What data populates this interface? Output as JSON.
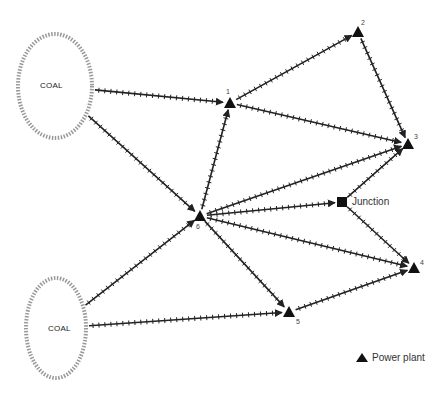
{
  "diagram": {
    "type": "network",
    "colors": {
      "edge": "#222222",
      "node": "#111111",
      "coal_outline": "#999999"
    },
    "sources": [
      {
        "id": "coal1",
        "label": "COAL",
        "cx": 55,
        "cy": 86,
        "rx": 37,
        "ry": 52
      },
      {
        "id": "coal2",
        "label": "COAL",
        "cx": 56,
        "cy": 328,
        "rx": 30,
        "ry": 50
      }
    ],
    "nodes": [
      {
        "id": "1",
        "label": "1",
        "type": "power-plant",
        "x": 230,
        "y": 103
      },
      {
        "id": "2",
        "label": "2",
        "type": "power-plant",
        "x": 358,
        "y": 32
      },
      {
        "id": "3",
        "label": "3",
        "type": "power-plant",
        "x": 408,
        "y": 144
      },
      {
        "id": "4",
        "label": "4",
        "type": "power-plant",
        "x": 414,
        "y": 268
      },
      {
        "id": "5",
        "label": "5",
        "type": "power-plant",
        "x": 289,
        "y": 312
      },
      {
        "id": "6",
        "label": "6",
        "type": "power-plant",
        "x": 200,
        "y": 216
      },
      {
        "id": "junction",
        "label": "Junction",
        "type": "junction",
        "x": 342,
        "y": 202
      }
    ],
    "edges": [
      {
        "from": "coal1",
        "to": "1"
      },
      {
        "from": "coal1",
        "to": "6"
      },
      {
        "from": "coal2",
        "to": "6"
      },
      {
        "from": "coal2",
        "to": "5"
      },
      {
        "from": "1",
        "to": "2"
      },
      {
        "from": "1",
        "to": "3"
      },
      {
        "from": "2",
        "to": "3"
      },
      {
        "from": "6",
        "to": "1"
      },
      {
        "from": "6",
        "to": "3"
      },
      {
        "from": "6",
        "to": "junction"
      },
      {
        "from": "6",
        "to": "4"
      },
      {
        "from": "6",
        "to": "5"
      },
      {
        "from": "junction",
        "to": "3"
      },
      {
        "from": "junction",
        "to": "4"
      },
      {
        "from": "5",
        "to": "4"
      }
    ]
  },
  "labels": {
    "coal_top": "COAL",
    "coal_bottom": "COAL",
    "n1": "1",
    "n2": "2",
    "n3": "3",
    "n4": "4",
    "n5": "5",
    "n6": "6",
    "junction": "Junction"
  },
  "legend": {
    "power_plant_label": "Power plant",
    "power_plant_icon": "triangle-icon"
  }
}
